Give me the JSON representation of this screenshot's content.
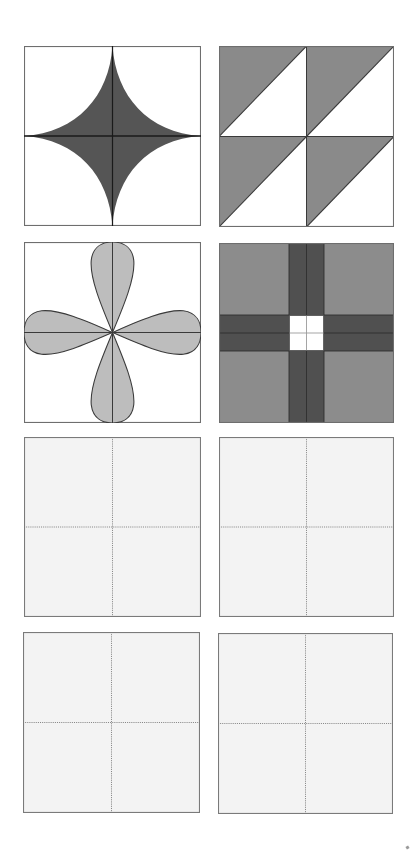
{
  "page": {
    "background": "#ffffff"
  },
  "colors": {
    "border": "#6e6e6e",
    "axis": "#1a1a1a",
    "astroid_fill": "#555555",
    "triangle_fill": "#8a8a8a",
    "lobe_fill": "#bdbdbd",
    "lobe_stroke": "#3a3a3a",
    "cross_outer": "#8c8c8c",
    "cross_band": "#505050",
    "cross_center": "#ffffff",
    "blank_fill": "#f3f3f3",
    "guide": "#7a7a7a"
  },
  "tiles": [
    {
      "id": "tile-1",
      "pattern": "astroid-star",
      "x": 24,
      "y": 46,
      "w": 177,
      "h": 180,
      "filled": true
    },
    {
      "id": "tile-2",
      "pattern": "half-square-triangles",
      "x": 219,
      "y": 46,
      "w": 175,
      "h": 181,
      "filled": true
    },
    {
      "id": "tile-3",
      "pattern": "four-petal-lobes",
      "x": 24,
      "y": 242,
      "w": 177,
      "h": 181,
      "filled": true
    },
    {
      "id": "tile-4",
      "pattern": "cross-with-white-center",
      "x": 219,
      "y": 243,
      "w": 175,
      "h": 180,
      "filled": true
    },
    {
      "id": "tile-5",
      "pattern": "blank-grid",
      "x": 24,
      "y": 437,
      "w": 177,
      "h": 180,
      "filled": false
    },
    {
      "id": "tile-6",
      "pattern": "blank-grid",
      "x": 219,
      "y": 437,
      "w": 175,
      "h": 180,
      "filled": false
    },
    {
      "id": "tile-7",
      "pattern": "blank-grid",
      "x": 23,
      "y": 632,
      "w": 177,
      "h": 181,
      "filled": false
    },
    {
      "id": "tile-8",
      "pattern": "blank-grid",
      "x": 218,
      "y": 633,
      "w": 175,
      "h": 181,
      "filled": false
    }
  ]
}
